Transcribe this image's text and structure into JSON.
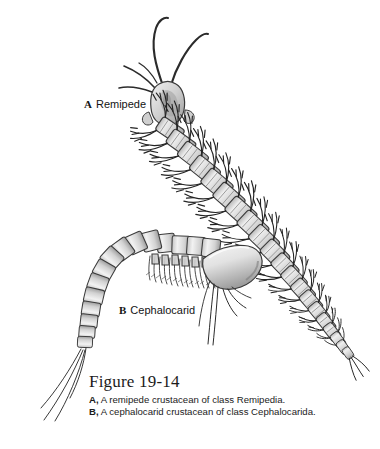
{
  "figure": {
    "background": "#ffffff",
    "ink": "#1b1b1b",
    "body_fill": "#d9d9d9",
    "body_fill_light": "#ececec",
    "shade": "#9a9a9a",
    "panels": [
      {
        "key": "a",
        "letter": "A",
        "name": "Remipede",
        "organism": "remipede crustacean",
        "class": "Remipedia",
        "segments": 21,
        "description": "Elongate worm-like crustacean with a rounded head bearing two long curving antennae and many similar trunk segments, each with a pair of lateral paddle-like swimming appendages."
      },
      {
        "key": "b",
        "letter": "B",
        "name": "Cephalocarid",
        "organism": "cephalocarid crustacean",
        "class": "Cephalocarida",
        "segments": 19,
        "description": "Small arched crustacean with a smooth horseshoe-shaped head shield, a row of setose thoracic limbs, a tapering segmented abdomen and two long caudal rami."
      }
    ]
  },
  "labels": {
    "a_letter": "A",
    "a_name": "Remipede",
    "b_letter": "B",
    "b_name": "Cephalocarid"
  },
  "caption": {
    "title": "Figure 19-14",
    "line_a_letter": "A,",
    "line_a_text": " A remipede crustacean of class Remipedia.",
    "line_b_letter": "B,",
    "line_b_text": " A cephalocarid crustacean of class Cephalocarida."
  }
}
